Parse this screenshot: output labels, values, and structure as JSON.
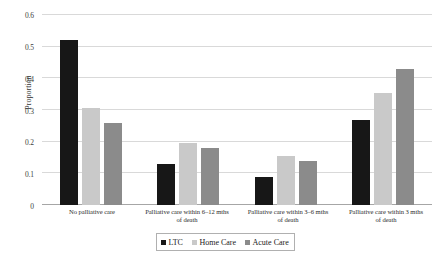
{
  "chart_data": {
    "type": "bar",
    "title": "",
    "xlabel": "",
    "ylabel": "Proportion",
    "ylim": [
      0,
      0.6
    ],
    "ytick_step": 0.1,
    "grid": true,
    "legend_position": "bottom",
    "categories": [
      "No palliative care",
      "Palliative care within 6–12 mths of death",
      "Palliative care within 3–6 mths of death",
      "Palliative care within 3 mths of death"
    ],
    "category_lines": [
      [
        "No palliative care"
      ],
      [
        "Palliative care within 6–12 mths",
        "of death"
      ],
      [
        "Palliative care within 3–6 mths",
        "of death"
      ],
      [
        "Palliative care within 3 mths",
        "of death"
      ]
    ],
    "ytick_labels": [
      "0",
      "0.1",
      "0.2",
      "0.3",
      "0.4",
      "0.5",
      "0.6"
    ],
    "ytick_values": [
      0,
      0.1,
      0.2,
      0.3,
      0.4,
      0.5,
      0.6
    ],
    "series": [
      {
        "name": "LTC",
        "color": "#171717",
        "values": [
          0.52,
          0.13,
          0.09,
          0.27
        ]
      },
      {
        "name": "Home Care",
        "color": "#c9c9c9",
        "values": [
          0.305,
          0.195,
          0.155,
          0.355
        ]
      },
      {
        "name": "Acute Care",
        "color": "#8b8b8b",
        "values": [
          0.26,
          0.18,
          0.14,
          0.43
        ]
      }
    ]
  },
  "legend": {
    "items": [
      {
        "label": "LTC"
      },
      {
        "label": "Home Care"
      },
      {
        "label": "Acute Care"
      }
    ]
  }
}
